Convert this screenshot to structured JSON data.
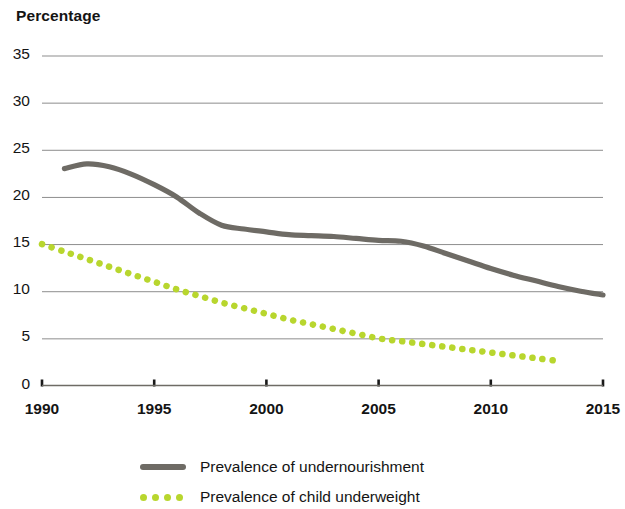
{
  "chart_data": {
    "type": "line",
    "title": "Percentage",
    "xlabel": "",
    "ylabel": "Percentage",
    "xlim": [
      1990,
      2015
    ],
    "ylim": [
      0,
      35
    ],
    "grid": true,
    "legend_position": "bottom",
    "y_ticks": [
      35,
      30,
      25,
      20,
      15,
      10,
      5,
      0
    ],
    "x_ticks": [
      1990,
      1995,
      2000,
      2005,
      2010,
      2015
    ],
    "series": [
      {
        "name": "Prevalence of undernourishment",
        "color": "#6e6b65",
        "style": "solid",
        "x": [
          1991,
          1992,
          1993,
          1994,
          1995,
          1996,
          1997,
          1998,
          1999,
          2000,
          2001,
          2002,
          2003,
          2004,
          2005,
          2006,
          2007,
          2008,
          2009,
          2010,
          2011,
          2012,
          2013,
          2014,
          2015
        ],
        "values": [
          23.0,
          23.5,
          23.2,
          22.4,
          21.3,
          20.0,
          18.3,
          17.0,
          16.6,
          16.3,
          16.0,
          15.9,
          15.8,
          15.6,
          15.4,
          15.3,
          14.8,
          14.0,
          13.2,
          12.4,
          11.7,
          11.1,
          10.5,
          10.0,
          9.6
        ]
      },
      {
        "name": "Prevalence of child underweight",
        "color": "#b8d62e",
        "style": "dotted",
        "x": [
          1990,
          1991,
          1992,
          1993,
          1994,
          1995,
          1996,
          1997,
          1998,
          1999,
          2000,
          2001,
          2002,
          2003,
          2004,
          2005,
          2006,
          2007,
          2008,
          2009,
          2010,
          2011,
          2012,
          2013
        ],
        "values": [
          15.0,
          14.2,
          13.4,
          12.6,
          11.8,
          11.0,
          10.2,
          9.5,
          8.8,
          8.2,
          7.6,
          7.0,
          6.5,
          6.0,
          5.5,
          5.0,
          4.7,
          4.4,
          4.1,
          3.8,
          3.5,
          3.2,
          2.9,
          2.6
        ]
      }
    ]
  },
  "legend": {
    "items": [
      {
        "label": "Prevalence of undernourishment",
        "color": "#6e6b65",
        "style": "solid"
      },
      {
        "label": "Prevalence of child underweight",
        "color": "#b8d62e",
        "style": "dotted"
      }
    ]
  }
}
